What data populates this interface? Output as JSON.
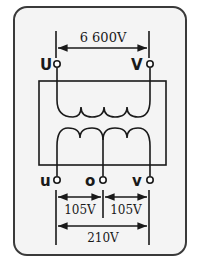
{
  "diagram": {
    "type": "single-phase three-wire transformer",
    "primary": {
      "voltage_label": "6 600V",
      "terminals": [
        {
          "label": "U"
        },
        {
          "label": "V"
        }
      ]
    },
    "secondary": {
      "terminals": [
        {
          "label": "u"
        },
        {
          "label": "o"
        },
        {
          "label": "v"
        }
      ],
      "voltage_labels": {
        "u_o": "105V",
        "o_v": "105V",
        "u_v": "210V"
      }
    },
    "colors": {
      "background": "#f4f4f4",
      "stroke": "#1a1a1a",
      "frame": "#3a3a3a"
    }
  }
}
